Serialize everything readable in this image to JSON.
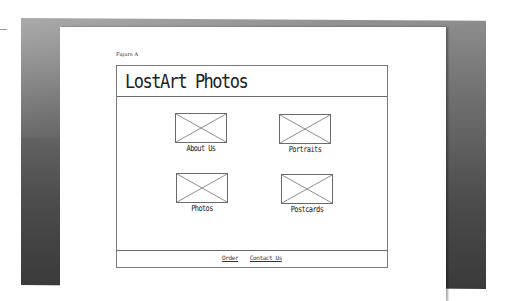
{
  "figure_label": "Figure A",
  "site": {
    "title": "LostArt Photos"
  },
  "tiles": [
    {
      "label": "About Us",
      "image": "image-placeholder-icon"
    },
    {
      "label": "Portraits",
      "image": "image-placeholder-icon"
    },
    {
      "label": "Photos",
      "image": "image-placeholder-icon"
    },
    {
      "label": "Postcards",
      "image": "image-placeholder-icon"
    }
  ],
  "footer": {
    "links": [
      "Order",
      "Contact Us"
    ]
  },
  "colors": {
    "frame_dark": "#3a3a3a",
    "frame_light": "#8e8e8e",
    "wire_line": "#6a6a6a",
    "paper": "#ffffff"
  }
}
